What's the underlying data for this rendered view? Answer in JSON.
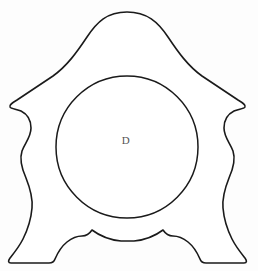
{
  "figure": {
    "type": "line-drawing",
    "background_color": "#fdfdfd",
    "stroke_color": "#1a1a1a",
    "fill_color": "#ffffff",
    "canvas": {
      "width": 258,
      "height": 271
    },
    "label": {
      "text": "D",
      "x": 126,
      "y": 140,
      "color": "#555555",
      "font_size": 11
    },
    "dial": {
      "name": "clock-dial-circle",
      "center_x": 127,
      "center_y": 147,
      "radius": 71,
      "stroke_color": "#1a1a1a",
      "stroke_width": 1.5
    },
    "silhouette": {
      "name": "clock-case-silhouette",
      "apex_x": 127,
      "apex_y": 12,
      "leftmost_x": 12,
      "rightmost_x": 246,
      "bump_y": 106,
      "baseline_y": 264,
      "stroke_width": 1.6,
      "path": "M 127 12 C 147 12 158 22 168 37 C 178 52 188 66 202 76 C 214 84 226 92 238 100 C 243 103 246 105 245 107 C 244 109 238 109 234 111 C 228 114 224 120 224 128 C 224 137 230 143 233 151 C 236 160 233 169 229 178 C 225 188 222 197 223 208 C 224 220 228 231 232 239 C 236 247 241 253 245 258 C 247 261 247 263 244 263 L 206 263 C 203 263 201 262 200 259 C 197 252 193 246 188 242 C 183 238 178 236 173 236 C 168 236 165 233 163 230 C 155 236 145 240 134 241 C 130 241 125 241 121 241 C 110 240 100 236 92 230 C 90 233 87 236 82 236 C 77 236 72 238 67 242 C 62 246 58 252 55 259 C 54 262 52 263 49 263 L 11 263 C 8 263 8 261 10 258 C 14 253 19 247 23 239 C 27 231 31 220 32 208 C 33 197 30 188 26 178 C 22 169 19 160 22 151 C 25 143 31 137 31 128 C 31 120 27 114 21 111 C 17 109 11 109 10 107 C 9 105 12 103 17 100 C 29 92 41 84 53 76 C 67 66 77 52 87 37 C 97 22 107 12 127 12 Z"
    }
  }
}
